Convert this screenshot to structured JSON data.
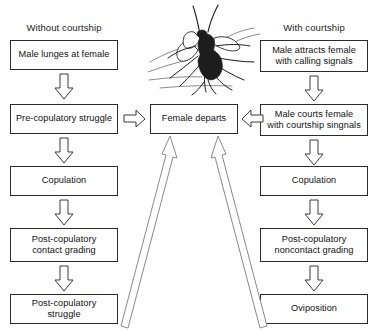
{
  "figure": {
    "type": "flowchart",
    "orientation": "two-column-converging",
    "background_color": "#ffffff",
    "box_border_color": "#2b2b2b",
    "arrow_outline_color": "#3a3a3a",
    "long_arrow_outline_color": "#8a8a8a"
  },
  "columns": {
    "left": {
      "heading": "Without courtship",
      "steps": [
        {
          "label": "Male lunges at female"
        },
        {
          "label": "Pre-copulatory struggle"
        },
        {
          "label": "Copulation"
        },
        {
          "line1": "Post-copulatory",
          "line2": "contact grading"
        },
        {
          "label": "Post-copulatory struggle"
        }
      ]
    },
    "right": {
      "heading": "With courtship",
      "steps": [
        {
          "line1": "Male attracts female",
          "line2": "with calling signals"
        },
        {
          "line1": "Male courts female",
          "line2": "with courtship singnals"
        },
        {
          "label": "Copulation"
        },
        {
          "line1": "Post-copulatory",
          "line2": "noncontact grading"
        },
        {
          "label": "Oviposition"
        }
      ]
    },
    "center": {
      "outcome_label": "Female departs"
    }
  },
  "connectors": {
    "left_down_1": "down-arrow-icon",
    "left_down_2": "down-arrow-icon",
    "left_down_3": "down-arrow-icon",
    "left_down_4": "down-arrow-icon",
    "right_down_1": "down-arrow-icon",
    "right_down_2": "down-arrow-icon",
    "right_down_3": "down-arrow-icon",
    "right_down_4": "down-arrow-icon",
    "left_to_center": "right-arrow-icon",
    "right_to_center": "left-arrow-icon",
    "bottom_left_to_center": "long-up-arrow-icon",
    "bottom_right_to_center": "long-up-arrow-icon"
  },
  "illustration": {
    "name": "mating-insects-illustration",
    "description": "Line drawing of two mating insects"
  }
}
